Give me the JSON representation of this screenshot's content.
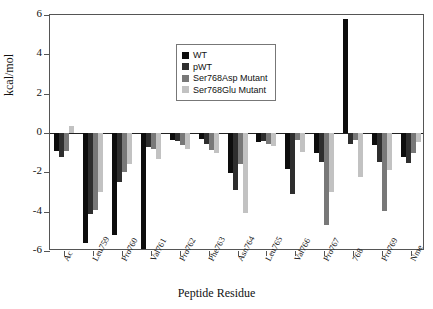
{
  "chart_data": {
    "type": "bar",
    "title": "",
    "xlabel": "Peptide Residue",
    "ylabel": "kcal/mol",
    "ylim": [
      -6,
      6
    ],
    "yticks": [
      6,
      4,
      2,
      0,
      -2,
      -4,
      -6
    ],
    "grid": false,
    "legend_position": "top-center",
    "categories": [
      "Ac",
      "Leu759",
      "Pro760",
      "Val761",
      "Pro762",
      "Phe763",
      "Asn764",
      "Leu765",
      "Val766",
      "Pro767",
      "768",
      "Pro769",
      "Nme"
    ],
    "series": [
      {
        "name": "WT",
        "color": "#0d0d0d",
        "values": [
          -0.9,
          -5.6,
          -5.2,
          -5.9,
          -0.35,
          -0.3,
          -2.05,
          -0.45,
          -1.85,
          -1.0,
          5.8,
          -0.6,
          -1.2
        ]
      },
      {
        "name": "pWT",
        "color": "#2e2e2e",
        "values": [
          -1.2,
          -4.1,
          -2.5,
          -0.7,
          -0.4,
          -0.55,
          -2.9,
          -0.4,
          -3.1,
          -1.45,
          -0.55,
          -1.45,
          -1.5
        ]
      },
      {
        "name": "Ser768Asp Mutant",
        "color": "#787878",
        "values": [
          -0.9,
          -3.9,
          -2.0,
          -0.8,
          -0.6,
          -0.85,
          -1.6,
          -0.55,
          -0.35,
          -4.7,
          -0.35,
          -3.95,
          -1.0
        ]
      },
      {
        "name": "Ser768Glu Mutant",
        "color": "#c2c2c2",
        "values": [
          0.35,
          -3.0,
          -1.6,
          -1.3,
          -0.8,
          -1.0,
          -4.05,
          -0.65,
          -0.95,
          -3.0,
          -2.25,
          -1.9,
          -0.45
        ]
      }
    ]
  },
  "axes": {
    "y_title": "kcal/mol",
    "x_title": "Peptide Residue",
    "y_tick_labels": [
      "6",
      "4",
      "2",
      "0",
      "-2",
      "-4",
      "-6"
    ],
    "x_tick_labels": [
      "Ac",
      "Leu759",
      "Pro760",
      "Val761",
      "Pro762",
      "Phe763",
      "Asn764",
      "Leu765",
      "Val766",
      "Pro767",
      "768",
      "Pro769",
      "Nme"
    ]
  },
  "legend": {
    "items": [
      {
        "label": "WT",
        "color": "#0d0d0d"
      },
      {
        "label": "pWT",
        "color": "#2e2e2e"
      },
      {
        "label": "Ser768Asp Mutant",
        "color": "#787878"
      },
      {
        "label": "Ser768Glu Mutant",
        "color": "#c2c2c2"
      }
    ]
  }
}
